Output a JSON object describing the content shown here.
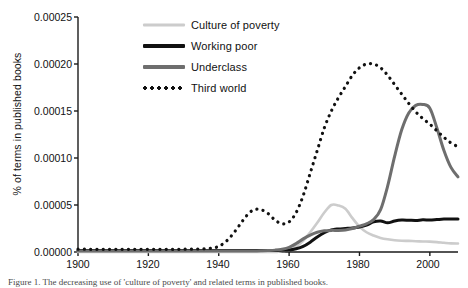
{
  "figure": {
    "caption": "Figure 1. The decreasing use of 'culture of poverty' and related terms in published books."
  },
  "chart_data": {
    "type": "line",
    "title": "",
    "xlabel": "",
    "ylabel": "% of terms in published books",
    "xlim": [
      1900,
      2008
    ],
    "ylim": [
      0.0,
      0.00025
    ],
    "grid": false,
    "legend_position": "upper-left-inside",
    "xticks": [
      1900,
      1920,
      1940,
      1960,
      1980,
      2000
    ],
    "xticklabels": [
      "1900",
      "1920",
      "1940",
      "1960",
      "1980",
      "2000"
    ],
    "yticks": [
      0.0,
      5e-05,
      0.0001,
      0.00015,
      0.0002,
      0.00025
    ],
    "yticklabels": [
      "0.00000",
      "0.00005",
      "0.00010",
      "0.00015",
      "0.00020",
      "0.00025"
    ],
    "colors": {
      "culture_of_poverty": "#cccccc",
      "working_poor": "#111111",
      "underclass": "#6e6e6e",
      "third_world": "#111111"
    },
    "x": [
      1900,
      1902,
      1904,
      1906,
      1908,
      1910,
      1912,
      1914,
      1916,
      1918,
      1920,
      1922,
      1924,
      1926,
      1928,
      1930,
      1932,
      1934,
      1936,
      1938,
      1940,
      1942,
      1944,
      1946,
      1948,
      1950,
      1952,
      1954,
      1956,
      1958,
      1960,
      1962,
      1964,
      1966,
      1968,
      1970,
      1972,
      1974,
      1976,
      1978,
      1980,
      1982,
      1984,
      1986,
      1988,
      1990,
      1992,
      1994,
      1996,
      1998,
      2000,
      2002,
      2004,
      2006,
      2008
    ],
    "series": [
      {
        "name": "Culture of poverty",
        "style": "solid",
        "color": "#cccccc",
        "values": [
          0.0,
          0.0,
          0.0,
          0.0,
          0.0,
          0.0,
          0.0,
          0.0,
          0.0,
          0.0,
          0.0,
          0.0,
          0.0,
          0.0,
          0.0,
          0.0,
          0.0,
          0.0,
          0.0,
          0.0,
          0.0,
          0.0,
          0.0,
          0.0,
          0.0,
          0.0,
          0.0,
          0.0,
          0.0,
          1e-06,
          2e-06,
          6e-06,
          1.2e-05,
          2.1e-05,
          3.1e-05,
          4.2e-05,
          5e-05,
          4.95e-05,
          4.6e-05,
          3.6e-05,
          2.7e-05,
          2.1e-05,
          1.75e-05,
          1.5e-05,
          1.35e-05,
          1.25e-05,
          1.2e-05,
          1.18e-05,
          1.15e-05,
          1.12e-05,
          1.1e-05,
          1.05e-05,
          9.8e-06,
          9.2e-06,
          9e-06
        ]
      },
      {
        "name": "Working poor",
        "style": "solid",
        "color": "#111111",
        "values": [
          1.5e-06,
          1.5e-06,
          1.5e-06,
          1.5e-06,
          1.5e-06,
          1.5e-06,
          1.5e-06,
          1.5e-06,
          1.5e-06,
          1.5e-06,
          1.5e-06,
          1.5e-06,
          1.5e-06,
          1.5e-06,
          1.5e-06,
          1.5e-06,
          1.5e-06,
          1.5e-06,
          1.5e-06,
          1.5e-06,
          1.5e-06,
          1.5e-06,
          1.5e-06,
          1.5e-06,
          1.5e-06,
          1.5e-06,
          1.5e-06,
          1.5e-06,
          1.5e-06,
          1.8e-06,
          2.2e-06,
          3.5e-06,
          6e-06,
          1.05e-05,
          1.6e-05,
          2.05e-05,
          2.35e-05,
          2.45e-05,
          2.5e-05,
          2.55e-05,
          2.65e-05,
          2.85e-05,
          3.2e-05,
          3.3e-05,
          3.1e-05,
          3.3e-05,
          3.4e-05,
          3.38e-05,
          3.35e-05,
          3.42e-05,
          3.4e-05,
          3.45e-05,
          3.5e-05,
          3.5e-05,
          3.5e-05
        ]
      },
      {
        "name": "Underclass",
        "style": "solid",
        "color": "#6e6e6e",
        "values": [
          1e-06,
          1e-06,
          1e-06,
          1e-06,
          1e-06,
          1e-06,
          1e-06,
          1e-06,
          1e-06,
          1e-06,
          1e-06,
          1e-06,
          1e-06,
          1e-06,
          1e-06,
          1e-06,
          1e-06,
          1e-06,
          1e-06,
          1e-06,
          1e-06,
          1e-06,
          1e-06,
          1e-06,
          1e-06,
          1e-06,
          1.2e-06,
          1.5e-06,
          2e-06,
          3e-06,
          5e-06,
          9e-06,
          1.4e-05,
          1.8e-05,
          2.1e-05,
          2.25e-05,
          2.3e-05,
          2.3e-05,
          2.35e-05,
          2.5e-05,
          2.75e-05,
          3e-05,
          3.45e-05,
          4.5e-05,
          7e-05,
          0.000102,
          0.00013,
          0.000148,
          0.000156,
          0.000157,
          0.000153,
          0.000132,
          0.000108,
          9e-05,
          8e-05
        ]
      },
      {
        "name": "Third world",
        "style": "dotted",
        "color": "#111111",
        "values": [
          3e-06,
          3e-06,
          2.8e-06,
          2.8e-06,
          2.8e-06,
          2.8e-06,
          2.8e-06,
          2.8e-06,
          2.8e-06,
          2.8e-06,
          2.8e-06,
          2.8e-06,
          2.8e-06,
          2.8e-06,
          2.8e-06,
          3e-06,
          3e-06,
          3.2e-06,
          3.5e-06,
          4e-06,
          6e-06,
          1.1e-05,
          1.9e-05,
          2.9e-05,
          3.9e-05,
          4.5e-05,
          4.5e-05,
          4.1e-05,
          3.4e-05,
          3e-05,
          3.2e-05,
          4.2e-05,
          6e-05,
          8.4e-05,
          0.000108,
          0.000132,
          0.00015,
          0.000164,
          0.000176,
          0.000188,
          0.000196,
          0.0002,
          0.0002,
          0.000196,
          0.000188,
          0.000178,
          0.000168,
          0.000158,
          0.000149,
          0.000142,
          0.000136,
          0.000129,
          0.000122,
          0.000116,
          0.000112
        ]
      }
    ]
  }
}
